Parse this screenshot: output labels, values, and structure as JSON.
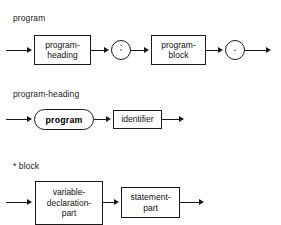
{
  "diagram_set": {
    "title": "Pascal syntax railroad diagrams",
    "line_color": "#1a1a1a",
    "background": "#ffffff"
  },
  "rules": [
    {
      "name": "program",
      "label": "program",
      "nodes": [
        {
          "kind": "nonterminal",
          "text_line_1": "program-",
          "text_line_2": "heading"
        },
        {
          "kind": "terminal-circle",
          "text": ";"
        },
        {
          "kind": "nonterminal",
          "text_line_1": "program-",
          "text_line_2": "block"
        },
        {
          "kind": "terminal-circle",
          "text": "."
        }
      ]
    },
    {
      "name": "program-heading",
      "label": "program-heading",
      "nodes": [
        {
          "kind": "terminal-stadium",
          "text": "program"
        },
        {
          "kind": "nonterminal",
          "text_line_1": "identifier",
          "text_line_2": ""
        }
      ]
    },
    {
      "name": "block",
      "label": "* block",
      "nodes": [
        {
          "kind": "nonterminal",
          "text_line_1": "variable-",
          "text_line_2": "declaration-",
          "text_line_3": "part"
        },
        {
          "kind": "nonterminal",
          "text_line_1": "statement-",
          "text_line_2": "part"
        }
      ]
    }
  ]
}
